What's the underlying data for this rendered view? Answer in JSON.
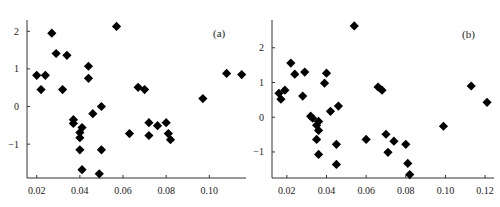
{
  "chart_data": [
    {
      "type": "scatter",
      "panel_label": "(a)",
      "title": "",
      "xlabel": "",
      "ylabel": "",
      "xlim": [
        0.0155,
        0.117
      ],
      "ylim": [
        -1.9,
        2.3
      ],
      "xticks": [
        0.02,
        0.04,
        0.06,
        0.08,
        0.1
      ],
      "xtick_labels": [
        "0.02",
        "0.04",
        "0.06",
        "0.08",
        "0.10"
      ],
      "yticks": [
        -1,
        0,
        1,
        2
      ],
      "ytick_labels": [
        "−1",
        "0",
        "1",
        "2"
      ],
      "grid": false,
      "marker": "diamond",
      "marker_color": "#000000",
      "points": [
        [
          0.02,
          0.83
        ],
        [
          0.022,
          0.45
        ],
        [
          0.024,
          0.83
        ],
        [
          0.027,
          1.95
        ],
        [
          0.029,
          1.41
        ],
        [
          0.034,
          1.36
        ],
        [
          0.032,
          0.45
        ],
        [
          0.044,
          1.07
        ],
        [
          0.044,
          0.75
        ],
        [
          0.057,
          2.13
        ],
        [
          0.05,
          0.0
        ],
        [
          0.046,
          -0.19
        ],
        [
          0.037,
          -0.35
        ],
        [
          0.037,
          -0.45
        ],
        [
          0.041,
          -0.56
        ],
        [
          0.04,
          -0.69
        ],
        [
          0.04,
          -0.83
        ],
        [
          0.04,
          -1.15
        ],
        [
          0.041,
          -1.68
        ],
        [
          0.05,
          -1.15
        ],
        [
          0.049,
          -1.79
        ],
        [
          0.063,
          -0.72
        ],
        [
          0.067,
          0.51
        ],
        [
          0.07,
          0.45
        ],
        [
          0.072,
          -0.43
        ],
        [
          0.072,
          -0.77
        ],
        [
          0.076,
          -0.51
        ],
        [
          0.08,
          -0.43
        ],
        [
          0.081,
          -0.72
        ],
        [
          0.082,
          -0.88
        ],
        [
          0.097,
          0.21
        ],
        [
          0.108,
          0.88
        ],
        [
          0.115,
          0.85
        ]
      ]
    },
    {
      "type": "scatter",
      "panel_label": "(b)",
      "title": "",
      "xlabel": "",
      "ylabel": "",
      "xlim": [
        0.0125,
        0.1245
      ],
      "ylim": [
        -1.75,
        2.8
      ],
      "xticks": [
        0.02,
        0.04,
        0.06,
        0.08,
        0.1,
        0.12
      ],
      "xtick_labels": [
        "0.02",
        "0.04",
        "0.06",
        "0.08",
        "0.10",
        "0.12"
      ],
      "yticks": [
        -1,
        0,
        1,
        2
      ],
      "ytick_labels": [
        "−1",
        "0",
        "1",
        "2"
      ],
      "grid": false,
      "marker": "diamond",
      "marker_color": "#000000",
      "points": [
        [
          0.016,
          0.69
        ],
        [
          0.017,
          0.52
        ],
        [
          0.019,
          0.78
        ],
        [
          0.022,
          1.56
        ],
        [
          0.024,
          1.24
        ],
        [
          0.028,
          0.61
        ],
        [
          0.029,
          1.3
        ],
        [
          0.04,
          1.27
        ],
        [
          0.039,
          0.98
        ],
        [
          0.054,
          2.63
        ],
        [
          0.032,
          0.03
        ],
        [
          0.033,
          -0.03
        ],
        [
          0.035,
          -0.23
        ],
        [
          0.036,
          -0.12
        ],
        [
          0.036,
          -0.38
        ],
        [
          0.035,
          -0.64
        ],
        [
          0.036,
          -1.07
        ],
        [
          0.042,
          0.17
        ],
        [
          0.046,
          0.32
        ],
        [
          0.045,
          -1.36
        ],
        [
          0.045,
          -0.78
        ],
        [
          0.06,
          -0.64
        ],
        [
          0.066,
          0.87
        ],
        [
          0.068,
          0.78
        ],
        [
          0.07,
          -0.49
        ],
        [
          0.071,
          -1.01
        ],
        [
          0.074,
          -0.69
        ],
        [
          0.08,
          -0.78
        ],
        [
          0.081,
          -1.33
        ],
        [
          0.082,
          -1.65
        ],
        [
          0.099,
          -0.26
        ],
        [
          0.113,
          0.9
        ],
        [
          0.121,
          0.43
        ]
      ]
    }
  ],
  "panels": [
    {
      "label": "(a)"
    },
    {
      "label": "(b)"
    }
  ]
}
